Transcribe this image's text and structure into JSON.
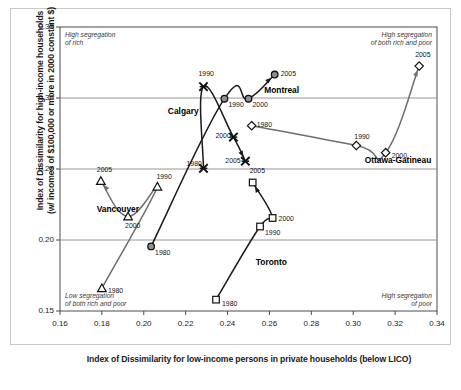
{
  "chart_data": {
    "type": "scatter",
    "title": "",
    "xlabel": "Index of Dissimilarity for low-income persons in private households (below LICO)",
    "ylabel": "Index of Dissimilarity for high-income households (w/ incomes of $100,000 or more in 2000 constant $)",
    "ylabel_line1": "Index of Dissimilarity for high-income households",
    "ylabel_line2": "(w/ incomes of $100,000 or more in 2000 constant $)",
    "xlim": [
      0.16,
      0.34
    ],
    "ylim": [
      0.15,
      0.35
    ],
    "xticks": [
      "0.16",
      "0.18",
      "0.20",
      "0.22",
      "0.24",
      "0.26",
      "0.28",
      "0.30",
      "0.32",
      "0.34"
    ],
    "yticks": [
      "0.35",
      "0.30",
      "0.25",
      "0.20",
      "0.15"
    ],
    "grid": "horizontal",
    "legend": "inline-series-labels",
    "annotations": [
      {
        "name": "top-left",
        "text_line1": "High segregation",
        "text_line2": "of rich"
      },
      {
        "name": "top-right",
        "text_line1": "High segregation",
        "text_line2": "of both rich and poor"
      },
      {
        "name": "bottom-left",
        "text_line1": "Low segregation",
        "text_line2": "of both rich and poor"
      },
      {
        "name": "bottom-right",
        "text_line1": "High segregation",
        "text_line2": "of poor"
      }
    ],
    "series": [
      {
        "name": "Calgary",
        "marker": "x-star",
        "color": "#1a1a1a",
        "label_pos": {
          "x": 0.2115,
          "y": 0.2905
        },
        "points": [
          {
            "year": "1980",
            "x": 0.2285,
            "y": 0.2505,
            "label_dx": -17,
            "label_dy": -4
          },
          {
            "year": "1990",
            "x": 0.2285,
            "y": 0.308,
            "label_dx": -5,
            "label_dy": -13
          },
          {
            "year": "2000",
            "x": 0.2428,
            "y": 0.2725,
            "label_dx": -18,
            "label_dy": -1
          },
          {
            "year": "2005",
            "x": 0.2485,
            "y": 0.2555,
            "label_dx": -20,
            "label_dy": 0
          }
        ]
      },
      {
        "name": "Montreal",
        "marker": "filled-circle",
        "color": "#1a1a1a",
        "label_pos": {
          "x": 0.2575,
          "y": 0.3055
        },
        "points": [
          {
            "year": "1980",
            "x": 0.2035,
            "y": 0.1955,
            "label_dx": 4,
            "label_dy": 7
          },
          {
            "year": "1990",
            "x": 0.2385,
            "y": 0.2995,
            "label_dx": 4,
            "label_dy": 6
          },
          {
            "year": "2000",
            "x": 0.25,
            "y": 0.2995,
            "label_dx": 4,
            "label_dy": 6
          },
          {
            "year": "2005",
            "x": 0.2625,
            "y": 0.3165,
            "label_dx": 6,
            "label_dy": -1
          }
        ]
      },
      {
        "name": "Ottawa-Gatineau",
        "marker": "open-diamond",
        "color": "#6e6e6e",
        "label_pos": {
          "x": 0.3055,
          "y": 0.2565
        },
        "points": [
          {
            "year": "1980",
            "x": 0.2515,
            "y": 0.2805,
            "label_dx": 5,
            "label_dy": -1
          },
          {
            "year": "1990",
            "x": 0.3015,
            "y": 0.2665,
            "label_dx": -2,
            "label_dy": -9
          },
          {
            "year": "2000",
            "x": 0.3155,
            "y": 0.2615,
            "label_dx": 6,
            "label_dy": 3
          },
          {
            "year": "2005",
            "x": 0.3315,
            "y": 0.3225,
            "label_dx": -4,
            "label_dy": -11
          }
        ]
      },
      {
        "name": "Toronto",
        "marker": "open-square",
        "color": "#1a1a1a",
        "label_pos": {
          "x": 0.2535,
          "y": 0.1845
        },
        "points": [
          {
            "year": "1980",
            "x": 0.2345,
            "y": 0.158,
            "label_dx": 6,
            "label_dy": 4
          },
          {
            "year": "1990",
            "x": 0.2555,
            "y": 0.2095,
            "label_dx": 5,
            "label_dy": 6
          },
          {
            "year": "2000",
            "x": 0.2615,
            "y": 0.2155,
            "label_dx": 6,
            "label_dy": 1
          },
          {
            "year": "2005",
            "x": 0.252,
            "y": 0.2405,
            "label_dx": -3,
            "label_dy": -11
          }
        ]
      },
      {
        "name": "Vancouver",
        "marker": "open-triangle",
        "color": "#6e6e6e",
        "label_pos": {
          "x": 0.1775,
          "y": 0.2215
        },
        "points": [
          {
            "year": "1980",
            "x": 0.18,
            "y": 0.166,
            "label_dx": 6,
            "label_dy": 3
          },
          {
            "year": "1990",
            "x": 0.2065,
            "y": 0.2375,
            "label_dx": -1,
            "label_dy": -10
          },
          {
            "year": "2000",
            "x": 0.1925,
            "y": 0.2165,
            "label_dx": -3,
            "label_dy": 9
          },
          {
            "year": "2005",
            "x": 0.1795,
            "y": 0.2415,
            "label_dx": -4,
            "label_dy": -11
          }
        ]
      }
    ]
  }
}
